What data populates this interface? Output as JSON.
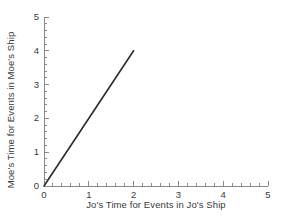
{
  "chart_data": {
    "type": "line",
    "title": "",
    "xlabel": "Jo's Time for Events in Jo's Ship",
    "ylabel": "Moe's Time for Events in Moe's Ship",
    "xlim": [
      0,
      5
    ],
    "ylim": [
      0,
      5
    ],
    "xticks": [
      0,
      1,
      2,
      3,
      4,
      5
    ],
    "yticks": [
      0,
      1,
      2,
      3,
      4,
      5
    ],
    "xtick_labels": [
      "0",
      "1",
      "2",
      "3",
      "4",
      "5"
    ],
    "ytick_labels": [
      "0",
      "1",
      "2",
      "3",
      "4",
      "5"
    ],
    "minor_ticks_per_interval": 5,
    "grid": false,
    "legend": null,
    "series": [
      {
        "name": "Moe vs Jo time",
        "x": [
          0,
          2
        ],
        "y": [
          0,
          4
        ],
        "slope": 2,
        "intercept": 0,
        "color": "#2b2b2b",
        "linewidth": 1.6
      }
    ],
    "axis_color": "#8a8a8a",
    "text_color": "#3a3a3a",
    "background": "#ffffff"
  }
}
